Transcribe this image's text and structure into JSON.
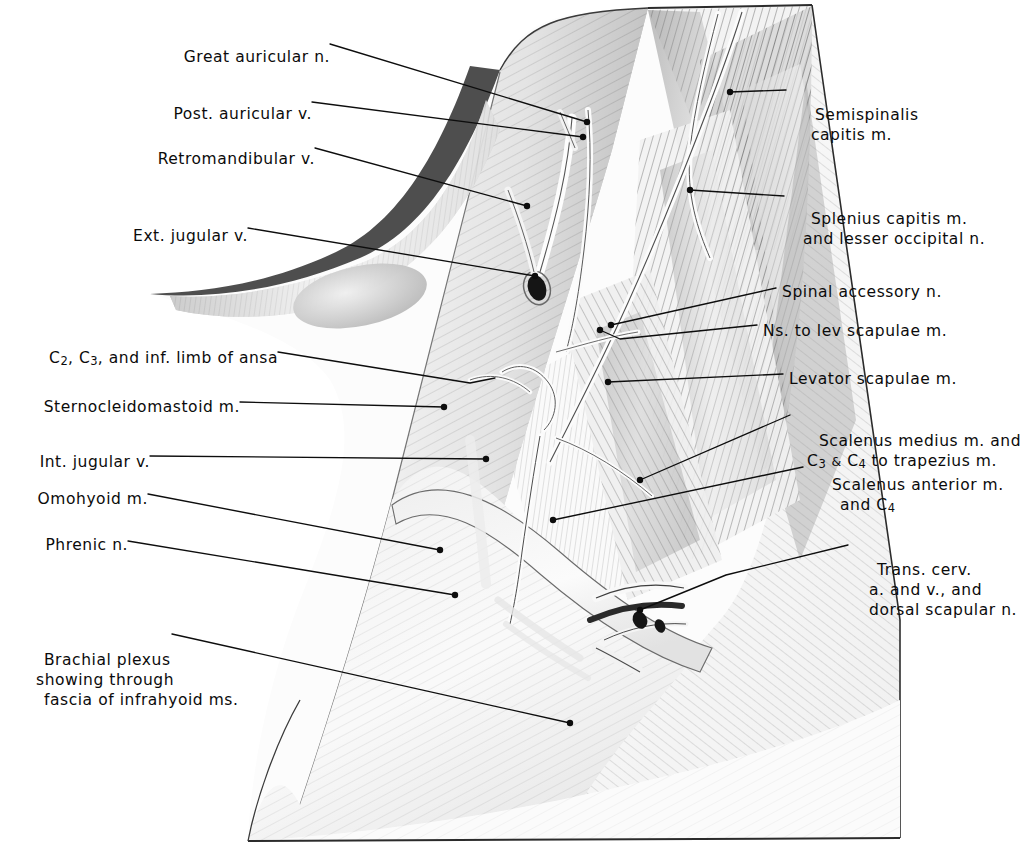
{
  "plate": {
    "title": "Posterior cervical triangle dissection",
    "background_color": "#ffffff",
    "ink_color": "#0b0b0b",
    "width": 1032,
    "height": 853
  },
  "labels_left": [
    {
      "id": "great-auricular-n",
      "text": "Great auricular n.",
      "x": 176,
      "y": 47
    },
    {
      "id": "post-auricular-v",
      "text": "Post. auricular v.",
      "x": 158,
      "y": 104
    },
    {
      "id": "retromandibular-v",
      "text": "Retromandibular v.",
      "x": 146,
      "y": 149
    },
    {
      "id": "ext-jugular-v",
      "text": "Ext. jugular v.",
      "x": 125,
      "y": 226
    },
    {
      "id": "c2-c3-inf-limb-ansa",
      "text": "C2, C3, and inf. limb of ansa",
      "x": 18,
      "y": 348
    },
    {
      "id": "sternocleidomastoid-m",
      "text": "Sternocleidomastoid m.",
      "x": 20,
      "y": 397
    },
    {
      "id": "int-jugular-v",
      "text": "Int. jugular v.",
      "x": 32,
      "y": 452
    },
    {
      "id": "omohyoid-m",
      "text": "Omohyoid m.",
      "x": 36,
      "y": 489
    },
    {
      "id": "phrenic-n",
      "text": "Phrenic n.",
      "x": 36,
      "y": 535
    },
    {
      "id": "brachial-plexus",
      "text": "Brachial plexus",
      "x": 22,
      "y": 630
    }
  ],
  "labels_left_multiline": {
    "brachial_plexus_line2": "showing through",
    "brachial_plexus_line3": "fascia of infrahyoid ms."
  },
  "labels_right": [
    {
      "id": "semispinalis-capitis-m",
      "line1": "Semispinalis",
      "line2": "capitis m.",
      "x": 793,
      "y": 85
    },
    {
      "id": "splenius-capitis-m",
      "line1": "Splenius capitis m.",
      "line2": "and lesser occipital n.",
      "x": 789,
      "y": 189
    },
    {
      "id": "spinal-accessory-n",
      "line1": "Spinal accessory n.",
      "line2": "",
      "x": 782,
      "y": 282
    },
    {
      "id": "ns-to-lev-scapulae-m",
      "line1": "Ns. to lev scapulae m.",
      "line2": "",
      "x": 763,
      "y": 321
    },
    {
      "id": "levator-scapulae-m",
      "line1": "Levator scapulae m.",
      "line2": "",
      "x": 789,
      "y": 369
    },
    {
      "id": "scalenus-medius-m",
      "line1": "Scalenus medius m. and",
      "line2": "C3 & C4 to trapezius m.",
      "x": 797,
      "y": 411
    },
    {
      "id": "scalenus-anterior-m",
      "line1": "Scalenus anterior m.",
      "line2": "and C4",
      "x": 810,
      "y": 455
    },
    {
      "id": "trans-cerv-a-v",
      "line1": "Trans. cerv.",
      "line2": "a. and v., and",
      "x": 855,
      "y": 540
    }
  ],
  "labels_right_extra": {
    "trans_cerv_line3": "dorsal scapular n."
  },
  "c_numerals": {
    "c2": "2",
    "c3": "3",
    "c4": "4",
    "ampersand": "&"
  },
  "leader_lines": [
    {
      "id": "leader-great-auricular-n",
      "points": "330,44 587,122"
    },
    {
      "id": "leader-post-auricular-v",
      "points": "312,102 583,137"
    },
    {
      "id": "leader-retromandibular-v",
      "points": "315,148 527,206"
    },
    {
      "id": "leader-ext-jugular-v",
      "points": "248,228 535,276"
    },
    {
      "id": "leader-c2-c3-ansa",
      "points": "278,352 470,383 495,378"
    },
    {
      "id": "leader-sternocleidomastoid-m",
      "points": "240,402 444,407"
    },
    {
      "id": "leader-int-jugular-v",
      "points": "150,456 486,459"
    },
    {
      "id": "leader-omohyoid-m",
      "points": "148,494 440,550"
    },
    {
      "id": "leader-phrenic-n",
      "points": "128,541 455,595"
    },
    {
      "id": "leader-brachial-plexus",
      "points": "172,634 570,723"
    },
    {
      "id": "leader-semispinalis",
      "points": "786,90 730,92"
    },
    {
      "id": "leader-splenius-capitis",
      "points": "784,196 690,190"
    },
    {
      "id": "leader-spinal-accessory",
      "points": "776,288 611,325"
    },
    {
      "id": "leader-ns-lev-scapulae",
      "points": "757,325 620,339 600,330"
    },
    {
      "id": "leader-levator-scapulae",
      "points": "783,374 608,382"
    },
    {
      "id": "leader-scalenus-medius",
      "points": "790,415 640,480"
    },
    {
      "id": "leader-scalenus-anterior",
      "points": "803,467 553,520"
    },
    {
      "id": "leader-trans-cerv",
      "points": "848,545 726,575 640,610"
    }
  ],
  "leader_dots": [
    {
      "id": "dot-great-auricular-n",
      "x": 587,
      "y": 122
    },
    {
      "id": "dot-post-auricular-v",
      "x": 583,
      "y": 137
    },
    {
      "id": "dot-retromandibular-v",
      "x": 527,
      "y": 206
    },
    {
      "id": "dot-ext-jugular-v",
      "x": 535,
      "y": 276
    },
    {
      "id": "dot-sternocleidomastoid-m",
      "x": 444,
      "y": 407
    },
    {
      "id": "dot-int-jugular-v",
      "x": 486,
      "y": 459
    },
    {
      "id": "dot-omohyoid-m",
      "x": 440,
      "y": 550
    },
    {
      "id": "dot-phrenic-n",
      "x": 455,
      "y": 595
    },
    {
      "id": "dot-brachial-plexus",
      "x": 570,
      "y": 723
    },
    {
      "id": "dot-semispinalis",
      "x": 730,
      "y": 92
    },
    {
      "id": "dot-splenius-capitis",
      "x": 690,
      "y": 190
    },
    {
      "id": "dot-spinal-accessory",
      "x": 611,
      "y": 325
    },
    {
      "id": "dot-levator-scapulae",
      "x": 608,
      "y": 382
    },
    {
      "id": "dot-ns-lev-scapulae",
      "x": 600,
      "y": 330
    },
    {
      "id": "dot-scalenus-medius",
      "x": 640,
      "y": 480
    },
    {
      "id": "dot-scalenus-anterior",
      "x": 553,
      "y": 520
    },
    {
      "id": "dot-trans-cerv",
      "x": 640,
      "y": 610
    }
  ],
  "figure": {
    "outline_note": "trapezoidal dissection field of lateral neck",
    "outer_top_edge": "648,8 812,5",
    "outer_right_edge": "812,5 900,620 900,838",
    "outer_bottom_edge": "248,841 900,838"
  }
}
